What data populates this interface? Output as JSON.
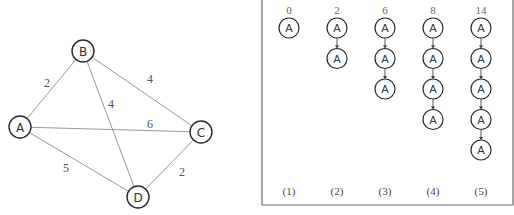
{
  "graph": {
    "nodes": [
      {
        "id": "A",
        "label": "A",
        "x": 20,
        "y": 127
      },
      {
        "id": "B",
        "label": "B",
        "x": 83,
        "y": 51
      },
      {
        "id": "C",
        "label": "C",
        "x": 201,
        "y": 132
      },
      {
        "id": "D",
        "label": "D",
        "x": 138,
        "y": 197
      }
    ],
    "edges": [
      {
        "from": "A",
        "to": "B",
        "weight": "2",
        "lx": 47,
        "ly": 83
      },
      {
        "from": "B",
        "to": "C",
        "weight": "4",
        "lx": 150,
        "ly": 79
      },
      {
        "from": "B",
        "to": "D",
        "weight": "4",
        "lx": 111,
        "ly": 104
      },
      {
        "from": "A",
        "to": "C",
        "weight": "6",
        "lx": 150,
        "ly": 124
      },
      {
        "from": "A",
        "to": "D",
        "weight": "5",
        "lx": 66,
        "ly": 168
      },
      {
        "from": "C",
        "to": "D",
        "weight": "2",
        "lx": 182,
        "ly": 172
      }
    ]
  },
  "chains": {
    "columns": [
      {
        "step": "(1)",
        "cost": "0",
        "x": 289,
        "nodes": [
          "A"
        ]
      },
      {
        "step": "(2)",
        "cost": "2",
        "x": 337,
        "nodes": [
          "A",
          "A"
        ]
      },
      {
        "step": "(3)",
        "cost": "6",
        "x": 385,
        "nodes": [
          "A",
          "A",
          "A"
        ]
      },
      {
        "step": "(4)",
        "cost": "8",
        "x": 433,
        "nodes": [
          "A",
          "A",
          "A",
          "A"
        ]
      },
      {
        "step": "(5)",
        "cost": "14",
        "x": 481,
        "nodes": [
          "A",
          "A",
          "A",
          "A",
          "A"
        ]
      }
    ],
    "layout": {
      "cost_y": 10,
      "first_node_y": 28,
      "spacing": 30.5,
      "radius": 10,
      "step_y": 191
    }
  },
  "frame": {
    "left": 262,
    "right": 513,
    "bottom": 205
  }
}
